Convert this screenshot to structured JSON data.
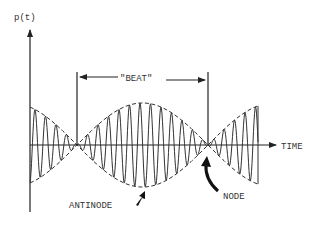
{
  "diagram": {
    "y_axis_label": "p(t)",
    "x_axis_label": "TIME",
    "beat_label": "\"BEAT\"",
    "antinode_label": "ANTINODE",
    "node_label": "NODE",
    "ink_color": "#333333",
    "background_color": "#ffffff"
  }
}
